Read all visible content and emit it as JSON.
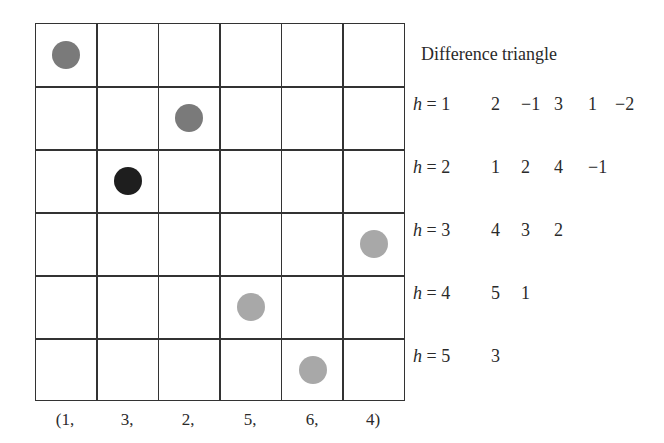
{
  "grid": {
    "rows": 6,
    "cols": 6
  },
  "permutation": [
    1,
    3,
    2,
    5,
    6,
    4
  ],
  "x_labels": [
    "(1,",
    "3,",
    "2,",
    "5,",
    "6,",
    "4)"
  ],
  "dots": [
    {
      "col": 1,
      "row": 1,
      "color": "#7a7a7a"
    },
    {
      "col": 3,
      "row": 2,
      "color": "#7a7a7a"
    },
    {
      "col": 2,
      "row": 3,
      "color": "#1e1e1e"
    },
    {
      "col": 6,
      "row": 4,
      "color": "#a8a8a8"
    },
    {
      "col": 4,
      "row": 5,
      "color": "#a8a8a8"
    },
    {
      "col": 5,
      "row": 6,
      "color": "#a8a8a8"
    }
  ],
  "triangle": {
    "title": "Difference triangle",
    "rows": [
      {
        "h_var": "h",
        "eq": " = 1",
        "values": [
          "2",
          "−1",
          "3",
          "1",
          "−2"
        ]
      },
      {
        "h_var": "h",
        "eq": " = 2",
        "values": [
          "1",
          "2",
          "4",
          "−1"
        ]
      },
      {
        "h_var": "h",
        "eq": " = 3",
        "values": [
          "4",
          "3",
          "2"
        ]
      },
      {
        "h_var": "h",
        "eq": " = 4",
        "values": [
          "5",
          "1"
        ]
      },
      {
        "h_var": "h",
        "eq": " = 5",
        "values": [
          "3"
        ]
      }
    ]
  }
}
